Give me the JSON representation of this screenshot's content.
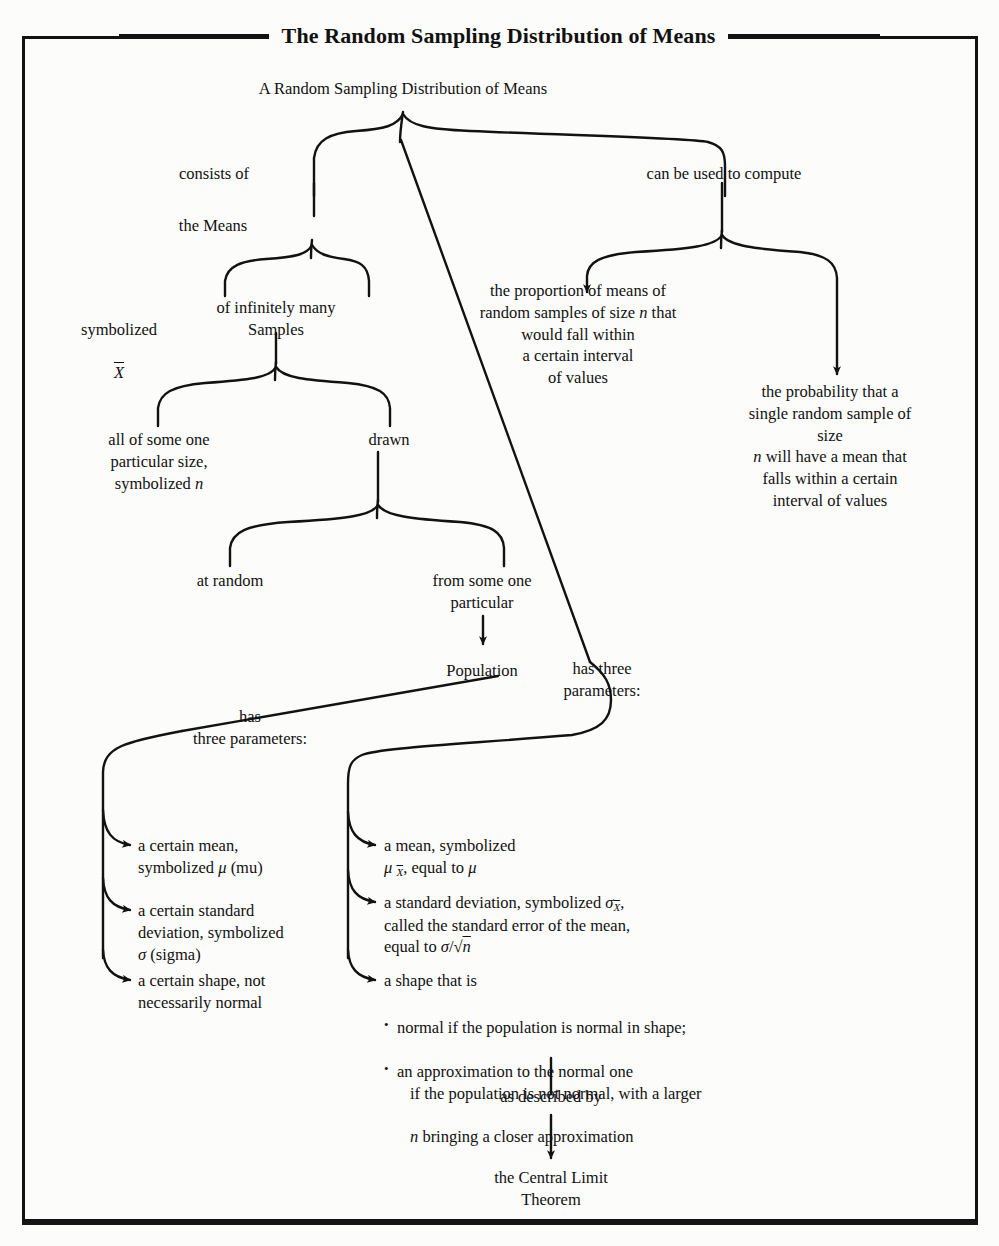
{
  "page": {
    "title": "The Random Sampling Distribution of Means",
    "ink_color": "#121212",
    "paper_color": "#fcfcfa"
  },
  "diagram": {
    "type": "tree-flowchart",
    "root": "A Random Sampling Distribution of Means",
    "nodes": {
      "root": "A Random Sampling Distribution of Means",
      "consists_of": "consists of",
      "can_be_used_to_compute": "can be used to compute",
      "the_means": "the Means",
      "symbolized_xbar_l1": "symbolized",
      "symbolized_xbar_l2": "X",
      "of_infinitely_many_samples": "of infinitely many\nSamples",
      "all_of_some_one": "all of some one\nparticular size,\nsymbolized n",
      "drawn": "drawn",
      "at_random": "at random",
      "from_some_one_particular": "from some one\nparticular",
      "population": "Population",
      "proportion_of_means": "the proportion of means of\nrandom samples of size n that\nwould fall within\na certain interval\nof values",
      "probability_that": "the probability that a\nsingle random sample of size\nn will have a mean that\nfalls within a certain\ninterval of values",
      "pop_has_three_parameters": "has\nthree parameters:",
      "rsdm_has_three_parameters": "has three\nparameters:",
      "as_described_by": "as described by",
      "central_limit_theorem": "the Central Limit\nTheorem"
    },
    "population_parameters": [
      "a certain mean,\nsymbolized μ (mu)",
      "a certain standard\ndeviation, symbolized\nσ (sigma)",
      "a certain shape, not\nnecessarily normal"
    ],
    "sampling_dist_parameters": {
      "mean": {
        "line1": "a mean, symbolized",
        "line2_prefix": "μ ",
        "line2_sub": "X",
        "line2_suffix": ", equal to μ"
      },
      "std_dev": {
        "line1_prefix": "a standard deviation, symbolized σ",
        "line1_sub": "X",
        "line1_suffix": ",",
        "line2": "called the standard error of the mean,",
        "line3": "equal to σ/√n"
      },
      "shape": {
        "header": "a shape that is",
        "bullets": [
          "normal if the population is normal in shape;",
          "an approximation to the normal one"
        ],
        "bullet2_cont_1": "if the population is not normal, with a larger",
        "bullet2_cont_2": "n bringing a closer approximation"
      }
    }
  }
}
